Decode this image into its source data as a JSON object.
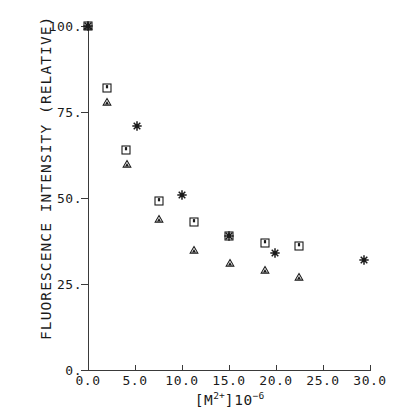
{
  "chart_data": {
    "type": "scatter",
    "title": "",
    "xlabel": "[M2+]10-6",
    "ylabel": "FLUORESCENCE INTENSITY (RELATIVE)",
    "xlim": [
      0,
      30
    ],
    "ylim": [
      0,
      100
    ],
    "grid": false,
    "legend": "none",
    "xticks": [
      "0.0",
      "5.0",
      "10.0",
      "15.0",
      "20.0",
      "25.0",
      "30.0"
    ],
    "xtick_values": [
      0,
      5,
      10,
      15,
      20,
      25,
      30
    ],
    "yticks": [
      "0.",
      "25.",
      "50.",
      "75.",
      "100."
    ],
    "ytick_values": [
      0,
      25,
      50,
      75,
      100
    ],
    "series": [
      {
        "name": "square-series",
        "marker": "square",
        "points": [
          {
            "x": 0.0,
            "y": 100
          },
          {
            "x": 2.0,
            "y": 82
          },
          {
            "x": 4.0,
            "y": 64
          },
          {
            "x": 7.6,
            "y": 49
          },
          {
            "x": 11.3,
            "y": 43
          },
          {
            "x": 15.0,
            "y": 39
          },
          {
            "x": 18.8,
            "y": 37
          },
          {
            "x": 22.4,
            "y": 36
          }
        ]
      },
      {
        "name": "triangle-series",
        "marker": "triangle",
        "points": [
          {
            "x": 0.0,
            "y": 100
          },
          {
            "x": 2.0,
            "y": 78
          },
          {
            "x": 4.1,
            "y": 60
          },
          {
            "x": 7.6,
            "y": 44
          },
          {
            "x": 11.3,
            "y": 35
          },
          {
            "x": 15.1,
            "y": 31
          },
          {
            "x": 18.8,
            "y": 29
          },
          {
            "x": 22.4,
            "y": 27
          }
        ]
      },
      {
        "name": "star-series",
        "marker": "star",
        "points": [
          {
            "x": 0.0,
            "y": 100
          },
          {
            "x": 5.2,
            "y": 71
          },
          {
            "x": 10.0,
            "y": 51
          },
          {
            "x": 15.0,
            "y": 39
          },
          {
            "x": 19.9,
            "y": 34
          },
          {
            "x": 29.4,
            "y": 32
          }
        ]
      }
    ]
  },
  "axis_title": {
    "y": "FLUORESCENCE INTENSITY (RELATIVE)",
    "x_base": "[M",
    "x_sup1": "2+",
    "x_mid": "]10",
    "x_sup2": "−6"
  },
  "style": {
    "ink": "#1a1a1a",
    "axis": "#3a3a3a",
    "background": "#ffffff"
  }
}
